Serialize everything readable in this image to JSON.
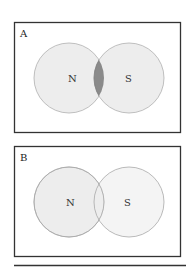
{
  "panels": [
    {
      "label": "A",
      "left_set": "N",
      "right_set": "S",
      "intersection_shaded": true
    },
    {
      "label": "B",
      "left_set": "N",
      "right_set": "S",
      "intersection_shaded": false
    }
  ],
  "colors": {
    "circle_fill": "#ededed",
    "circle_stroke": "#b0b0b0",
    "intersection_fill": "#8a8a8a",
    "frame": "#333333"
  }
}
